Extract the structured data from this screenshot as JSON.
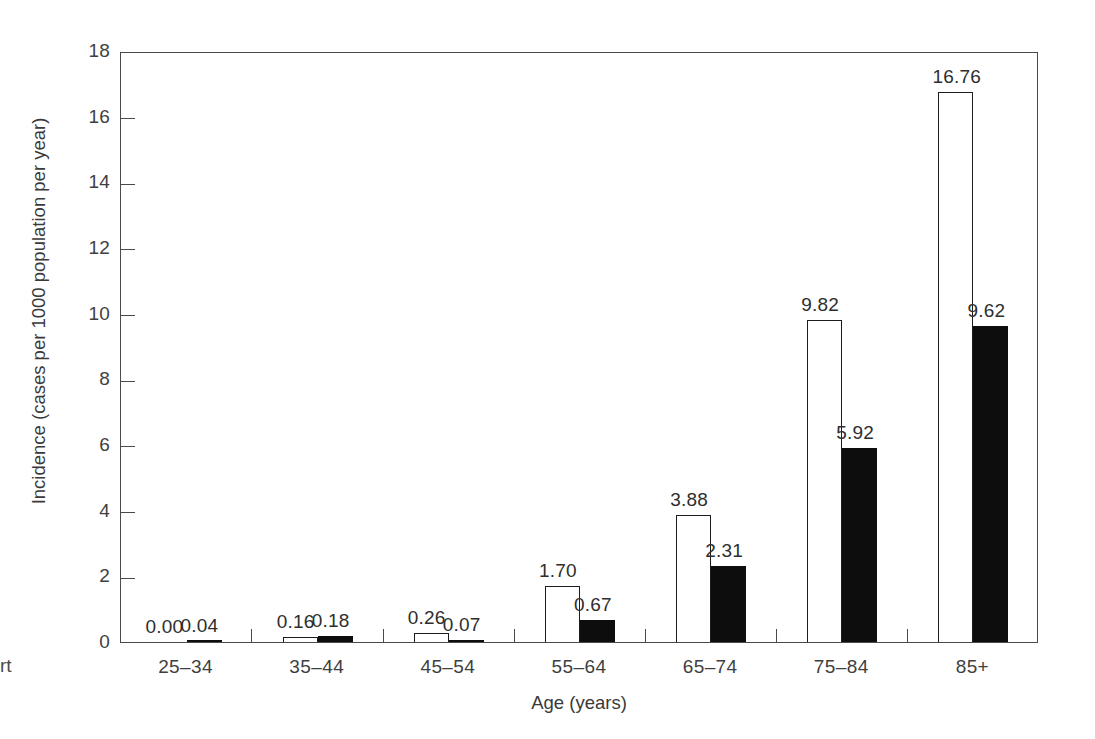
{
  "chart_data": {
    "type": "bar",
    "title": "",
    "subtitle": "",
    "xlabel": "Age (years)",
    "ylabel": "Incidence (cases per 1000 population per year)",
    "ylim": [
      0,
      18
    ],
    "ytick_labels": [
      "0",
      "2",
      "4",
      "6",
      "8",
      "10",
      "12",
      "14",
      "16",
      "18"
    ],
    "ytick_values": [
      0,
      2,
      4,
      6,
      8,
      10,
      12,
      14,
      16,
      18
    ],
    "grid": false,
    "legend": "none",
    "legend_entries": [],
    "categories": [
      "25–34",
      "35–44",
      "45–54",
      "55–64",
      "65–74",
      "75–84",
      "85+"
    ],
    "series": [
      {
        "name": "open",
        "style": "white-filled-black-outline",
        "values": [
          0.0,
          0.16,
          0.26,
          1.7,
          3.88,
          9.82,
          16.76
        ],
        "labels": [
          "0.00",
          "0.16",
          "0.26",
          "1.70",
          "3.88",
          "9.82",
          "16.76"
        ]
      },
      {
        "name": "filled",
        "style": "solid-black",
        "values": [
          0.04,
          0.18,
          0.07,
          0.67,
          2.31,
          5.92,
          9.62
        ],
        "labels": [
          "0.04",
          "0.18",
          "0.07",
          "0.67",
          "2.31",
          "5.92",
          "9.62"
        ]
      }
    ]
  },
  "colors": {
    "open_bar_fill": "#ffffff",
    "open_bar_stroke": "#1c1c1c",
    "filled_bar": "#0d0d0d",
    "axis": "#4a4a4a",
    "text": "#3a3a3a",
    "background": "#ffffff"
  },
  "caption_fragment": "rt"
}
